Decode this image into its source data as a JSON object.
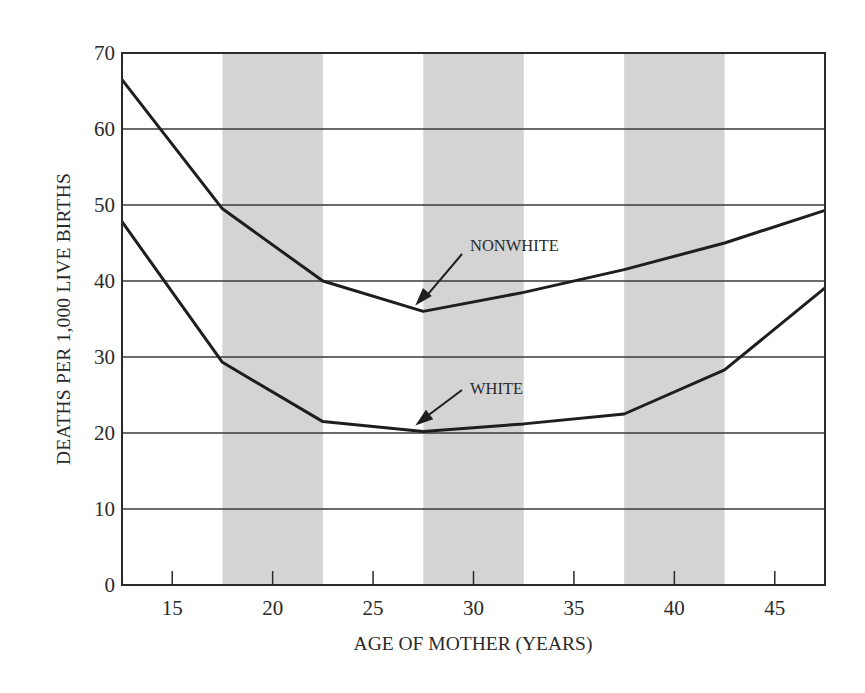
{
  "chart_data": {
    "type": "line",
    "title": "",
    "xlabel": "AGE OF MOTHER (YEARS)",
    "ylabel": "DEATHS PER 1,000 LIVE BIRTHS",
    "xlim": [
      12.5,
      47.5
    ],
    "ylim": [
      0,
      70
    ],
    "xticks": [
      15,
      20,
      25,
      30,
      35,
      40,
      45
    ],
    "yticks": [
      0,
      10,
      20,
      30,
      40,
      50,
      60,
      70
    ],
    "grid": {
      "horizontal": true,
      "vertical": false
    },
    "shaded_bands": [
      [
        17.5,
        22.5
      ],
      [
        27.5,
        32.5
      ],
      [
        37.5,
        42.5
      ]
    ],
    "x": [
      12.5,
      17.5,
      22.5,
      27.5,
      32.5,
      37.5,
      42.5,
      47.5
    ],
    "series": [
      {
        "name": "NONWHITE",
        "values": [
          66.5,
          49.5,
          40,
          36,
          38.5,
          41.5,
          45,
          49.3
        ]
      },
      {
        "name": "WHITE",
        "values": [
          47.8,
          29.3,
          21.5,
          20.2,
          21.2,
          22.5,
          28.3,
          39.1
        ]
      }
    ],
    "annotations": [
      {
        "text": "NONWHITE",
        "points_to": [
          27.5,
          36
        ]
      },
      {
        "text": "WHITE",
        "points_to": [
          27.5,
          20.2
        ]
      }
    ],
    "legend": null
  },
  "colors": {
    "line": "#1e1e1e",
    "band": "#d4d4d4",
    "grid": "#3a3a3a",
    "background": "#ffffff"
  }
}
